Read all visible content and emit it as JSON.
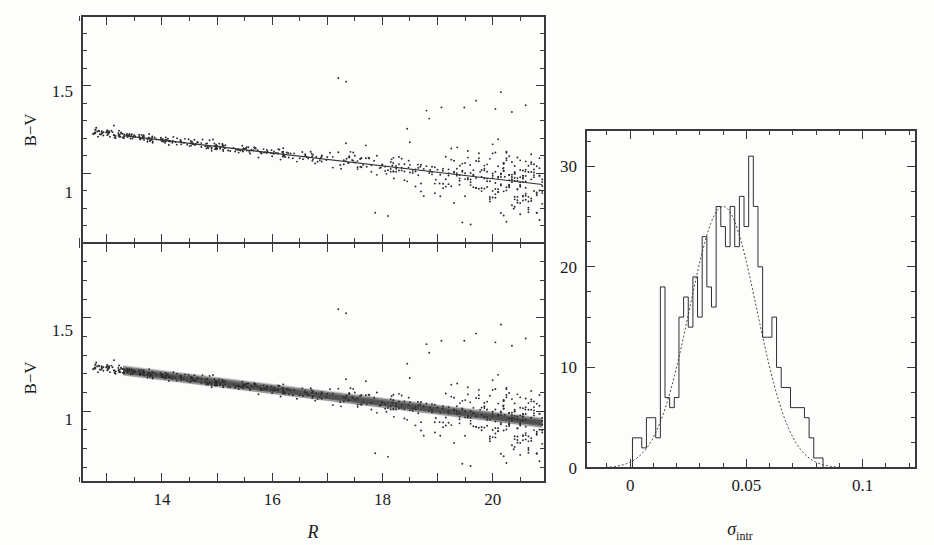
{
  "figure": {
    "title": "",
    "background": "#fdfdfc",
    "ink_color": "#2b2b2b"
  },
  "panels": {
    "top_left": {
      "name": "B-V versus R, single fit",
      "ylabel": "B−V",
      "xlabel": "",
      "ytick_labels": [
        "1.5",
        "1"
      ],
      "ytick_values": [
        1.5,
        1.0
      ],
      "ylim": [
        0.6,
        1.9
      ],
      "xlim": [
        12.55,
        20.95
      ],
      "xtick_values": [
        13,
        14,
        15,
        16,
        17,
        18,
        19,
        20
      ],
      "fit_line": {
        "x0": 13.3,
        "y0": 1.215,
        "x1": 20.9,
        "y1": 0.935
      }
    },
    "bottom_left": {
      "name": "B-V versus R, bootstrap fits",
      "ylabel": "B−V",
      "xlabel": "R",
      "ytick_labels": [
        "1.5",
        "1"
      ],
      "ytick_values": [
        1.5,
        1.0
      ],
      "ylim": [
        0.62,
        1.9
      ],
      "xlim": [
        12.55,
        20.95
      ],
      "xtick_labels": [
        "14",
        "16",
        "18",
        "20"
      ],
      "xtick_values": [
        14,
        16,
        18,
        20
      ],
      "xtick_minor": [
        13,
        15,
        17,
        19
      ],
      "band": {
        "x0": 13.3,
        "y0": 1.215,
        "x1": 20.9,
        "y1": 0.935,
        "spread": 0.02
      }
    },
    "right": {
      "name": "Histogram of intrinsic scatter",
      "xlabel": "σ",
      "xlabel_sub": "intr",
      "ylabel": "",
      "xtick_labels": [
        "0",
        "0.05",
        "0.1"
      ],
      "xtick_values": [
        0,
        0.05,
        0.1
      ],
      "ytick_labels": [
        "0",
        "10",
        "20",
        "30"
      ],
      "ytick_values": [
        0,
        10,
        20,
        30
      ],
      "xlim": [
        -0.019,
        0.123
      ],
      "ylim": [
        0,
        33.6
      ]
    }
  },
  "chart_data": [
    {
      "type": "scatter",
      "title": "B-V vs R (top panel, single best fit)",
      "xlabel": "R",
      "ylabel": "B-V",
      "xlim": [
        12.55,
        20.95
      ],
      "ylim": [
        0.6,
        1.9
      ],
      "grid": false,
      "legend": "none",
      "annotations": [
        "solid line = best-fit colour-magnitude relation"
      ],
      "fit": {
        "type": "line",
        "x": [
          13.3,
          20.9
        ],
        "y": [
          1.215,
          0.935
        ]
      },
      "n_points": 620,
      "x": [
        19.0,
        20.3,
        19.6,
        20.7,
        18.1,
        20.5,
        19.9,
        17.2,
        20.8,
        19.3,
        20.1,
        18.6,
        20.6,
        19.7,
        20.4,
        16.2,
        20.9,
        19.1,
        20.0,
        18.9,
        20.2,
        19.5,
        20.75,
        17.9,
        20.55,
        19.85,
        18.4,
        20.35,
        20.65,
        19.45,
        20.15,
        17.6,
        20.85,
        19.25,
        20.45,
        18.8,
        20.05,
        19.65,
        20.25,
        16.9,
        20.7,
        19.05,
        20.5,
        18.3,
        19.95,
        20.6,
        19.35,
        20.3,
        18.7,
        20.8,
        19.75,
        20.4,
        17.4,
        20.1,
        19.15,
        20.65,
        18.95,
        20.2,
        19.55,
        20.9,
        18.15,
        20.35,
        19.85,
        20.55,
        17.75,
        20.05,
        19.4,
        20.75,
        18.55,
        20.45,
        19.7,
        20.15,
        18.0,
        20.85,
        19.2,
        20.3,
        19.9,
        20.6,
        18.45,
        20.25,
        19.6,
        20.5,
        17.1,
        20.7,
        19.3,
        20.4,
        18.85,
        20.0,
        19.5,
        20.8,
        18.25,
        20.55,
        19.8,
        20.1,
        17.55,
        20.35,
        19.1,
        20.65,
        18.65,
        20.2,
        19.95,
        20.45,
        18.05,
        20.9,
        19.4,
        20.3,
        19.7,
        20.6,
        18.35,
        20.15,
        19.25,
        20.75,
        17.85,
        20.5,
        19.6,
        20.05,
        18.75,
        20.4,
        19.9,
        20.25,
        17.3,
        20.7,
        19.15,
        20.55,
        18.5,
        20.0,
        19.45,
        20.8,
        18.2,
        20.35,
        19.75,
        20.1,
        16.6,
        20.6,
        19.05,
        20.45,
        18.9,
        20.2,
        19.55,
        20.85,
        17.95,
        20.3,
        19.85,
        20.5,
        18.6,
        20.05,
        19.35,
        20.65,
        17.65,
        20.15,
        19.65,
        20.4,
        18.4,
        20.9,
        19.2,
        20.25,
        19.95,
        20.55,
        18.1,
        20.35,
        19.5,
        20.7,
        17.45,
        20.0,
        19.8,
        20.45,
        18.8,
        20.2,
        19.3,
        20.6,
        17.2,
        20.75,
        19.6,
        20.1,
        18.3,
        20.4,
        19.9,
        20.3,
        18.7,
        20.5,
        19.4,
        20.85,
        17.8,
        20.15,
        19.7,
        20.55,
        18.55,
        20.05,
        19.15,
        20.65,
        18.95,
        20.25,
        19.55,
        20.45,
        17.55,
        20.8,
        19.85,
        20.35,
        18.25,
        20.6,
        19.45,
        20.0,
        19.75,
        20.7,
        18.65,
        20.2,
        19.25,
        20.5,
        17.35,
        20.4,
        19.65,
        20.1,
        18.45,
        20.9,
        19.95,
        20.3,
        18.85,
        20.55,
        19.35,
        20.75,
        17.05,
        20.05,
        19.8,
        20.45,
        18.15,
        20.65,
        19.5,
        20.15,
        19.9,
        20.25,
        18.75,
        20.6,
        19.2,
        20.85,
        17.9,
        20.35,
        19.6,
        20.5,
        18.35,
        20.0,
        19.4,
        20.7,
        18.6,
        20.2,
        19.75,
        20.4,
        17.7,
        20.8,
        19.3,
        20.55,
        18.05,
        20.1,
        19.85,
        20.3,
        18.9,
        20.45,
        19.55,
        20.9,
        17.25,
        20.65,
        19.1,
        20.15,
        18.5,
        20.35,
        19.95,
        20.6,
        18.2,
        20.05,
        19.65,
        20.75,
        17.6,
        20.5,
        19.45,
        20.25,
        18.7,
        20.4,
        19.8,
        20.0,
        19.2,
        20.85,
        18.4,
        20.55,
        19.7,
        20.2,
        15.5,
        16.0,
        14.8,
        17.5,
        15.8,
        16.5,
        14.2,
        17.0,
        15.2,
        16.8,
        13.9,
        17.3,
        15.6,
        16.3,
        14.5,
        17.8,
        15.0,
        16.6,
        13.6,
        17.7,
        15.4,
        16.1,
        14.9,
        18.2,
        15.9,
        16.4,
        14.0,
        17.1,
        15.3,
        16.9,
        13.8,
        17.4,
        15.7,
        16.2,
        14.6,
        17.6,
        15.1,
        16.7,
        13.5,
        18.3
      ]
    },
    {
      "type": "histogram",
      "title": "Distribution of intrinsic scatter sigma_intr",
      "xlabel": "sigma_intr",
      "ylabel": "N",
      "xlim": [
        -0.019,
        0.123
      ],
      "ylim": [
        0,
        33.6
      ],
      "grid": false,
      "legend": "none",
      "bin_width": 0.002,
      "bin_starts": [
        -0.019,
        -0.017,
        -0.015,
        -0.013,
        -0.011,
        -0.009,
        -0.007,
        -0.005,
        -0.003,
        -0.001,
        0.001,
        0.003,
        0.005,
        0.007,
        0.009,
        0.011,
        0.013,
        0.015,
        0.017,
        0.019,
        0.021,
        0.023,
        0.025,
        0.027,
        0.029,
        0.031,
        0.033,
        0.035,
        0.037,
        0.039,
        0.041,
        0.043,
        0.045,
        0.047,
        0.049,
        0.051,
        0.053,
        0.055,
        0.057,
        0.059,
        0.061,
        0.063,
        0.065,
        0.067,
        0.069,
        0.071,
        0.073,
        0.075,
        0.077,
        0.079,
        0.081,
        0.083,
        0.085,
        0.087,
        0.089,
        0.091,
        0.093,
        0.095,
        0.097,
        0.099,
        0.101,
        0.103,
        0.105,
        0.107,
        0.109,
        0.111,
        0.113,
        0.115,
        0.117,
        0.119,
        0.121
      ],
      "counts": [
        0,
        0,
        0,
        0,
        0,
        0,
        0,
        0,
        0,
        0,
        3,
        3,
        2,
        5,
        5,
        3,
        18,
        7,
        6,
        7,
        15,
        17,
        14,
        19,
        15,
        23,
        18,
        16,
        26,
        24,
        22,
        26,
        22,
        27,
        24,
        31,
        26,
        20,
        13,
        13,
        15,
        10,
        8,
        8,
        6,
        6,
        6,
        5,
        3,
        1,
        1,
        0,
        0,
        0,
        0,
        0,
        0,
        0,
        0,
        0,
        0,
        0,
        0,
        0,
        0,
        0,
        0,
        0,
        0,
        0,
        0
      ],
      "fit_curve": {
        "type": "gaussian",
        "amplitude": 26.0,
        "mean": 0.04,
        "sigma": 0.0145,
        "style": "dotted"
      }
    }
  ]
}
